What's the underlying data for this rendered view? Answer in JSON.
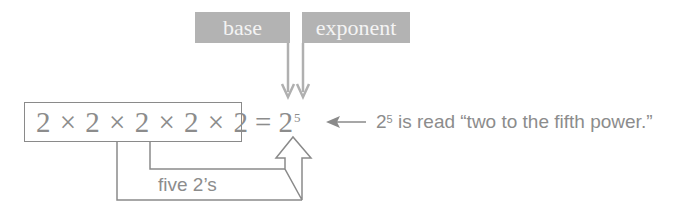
{
  "labels": {
    "base": "base",
    "exponent": "exponent"
  },
  "expression": {
    "product": "2 × 2 × 2 × 2 × 2",
    "equals": "= 2",
    "exponent_value": "5"
  },
  "explanation": {
    "base": "2",
    "exponent": "5",
    "text": " is read “two to the fifth power.”"
  },
  "count_label": "five 2’s",
  "colors": {
    "label_fill": "#b3b3b3",
    "label_text": "#f4f4f4",
    "line": "#8a8a8a",
    "text": "#8c8c8c"
  }
}
